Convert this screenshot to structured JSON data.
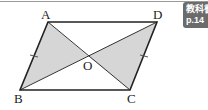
{
  "figure": {
    "type": "parallelogram with diagonals",
    "vertices": {
      "A": "A",
      "B": "B",
      "C": "C",
      "D": "D",
      "O": "O"
    },
    "shaded_triangles": [
      "ABO",
      "CDO"
    ],
    "tick_marks": [
      "AB",
      "DC"
    ]
  },
  "badge": {
    "line1": "教科書",
    "line2": "p.14"
  }
}
